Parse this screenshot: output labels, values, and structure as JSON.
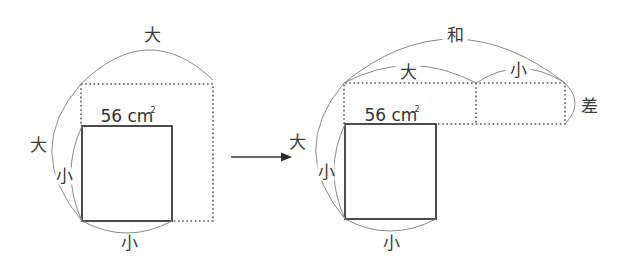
{
  "diagram": {
    "left_panel": {
      "area_label": "56 cm",
      "area_unit_superscript": "2",
      "labels": {
        "top_arc": "大",
        "left_outer_arc": "大",
        "left_inner_arc": "小",
        "bottom_arc": "小"
      }
    },
    "arrow": {
      "direction": "right"
    },
    "right_panel": {
      "area_label": "56 cm",
      "area_unit_superscript": "2",
      "labels": {
        "sum_arc": "和",
        "top_large_arc": "大",
        "top_small_arc": "小",
        "difference_arc": "差",
        "left_outer_arc": "大",
        "left_inner_arc": "小",
        "bottom_arc": "小"
      }
    },
    "colors": {
      "solid_line": "#3a3a3a",
      "dotted_line": "#555555",
      "arc_line": "#8a8a8a",
      "text": "#3a3a3a",
      "background": "#ffffff"
    }
  }
}
